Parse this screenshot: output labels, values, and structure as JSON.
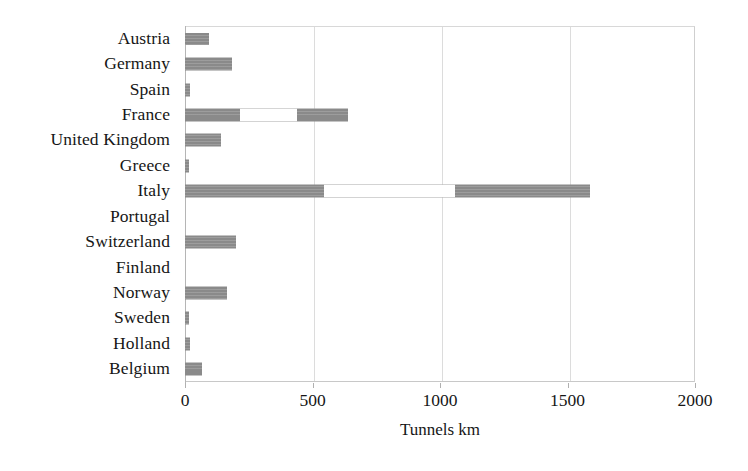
{
  "chart_data": {
    "type": "bar",
    "orientation": "horizontal",
    "title": "",
    "subtitle": "",
    "xlabel": "Tunnels km",
    "ylabel": "",
    "xlim": [
      0,
      2000
    ],
    "xticks": [
      0,
      500,
      1000,
      1500,
      2000
    ],
    "xtick_labels": [
      "0",
      "500",
      "1000",
      "1500",
      "2000"
    ],
    "grid": true,
    "grid_axis": "x",
    "legend": null,
    "legend_position": "none",
    "bar_color": "#8a8a8a",
    "categories": [
      "Austria",
      "Germany",
      "Spain",
      "France",
      "United Kingdom",
      "Greece",
      "Italy",
      "Portugal",
      "Switzerland",
      "Finland",
      "Norway",
      "Sweden",
      "Holland",
      "Belgium"
    ],
    "values": [
      95,
      185,
      20,
      640,
      140,
      15,
      1590,
      0,
      200,
      0,
      165,
      15,
      20,
      65
    ],
    "series": [
      {
        "name": "Tunnels km",
        "values": [
          95,
          185,
          20,
          640,
          140,
          15,
          1590,
          0,
          200,
          0,
          165,
          15,
          20,
          65
        ]
      }
    ]
  },
  "axis": {
    "x_title": "Tunnels km",
    "ticks": [
      "0",
      "500",
      "1000",
      "1500",
      "2000"
    ]
  }
}
